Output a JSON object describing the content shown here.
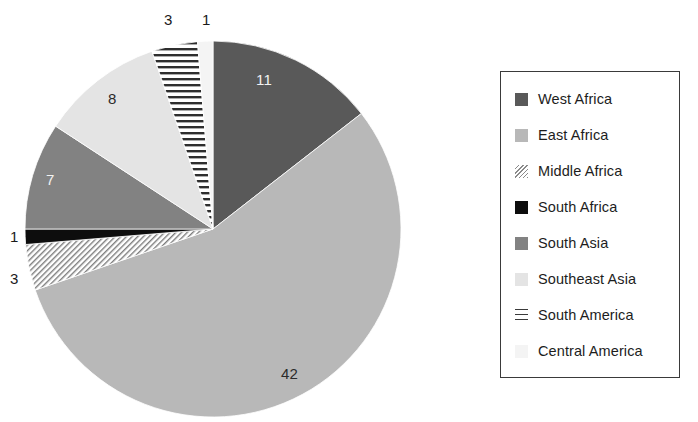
{
  "chart_data": {
    "type": "pie",
    "title": "",
    "subtitle": "",
    "xlabel": "",
    "ylabel": "",
    "total": 76,
    "start_angle_deg": 0,
    "direction": "clockwise",
    "legend_position": "right",
    "grid": false,
    "categories": [
      "West Africa",
      "East Africa",
      "Middle Africa",
      "South Africa",
      "South Asia",
      "Southeast Asia",
      "South America",
      "Central America"
    ],
    "values": [
      11,
      42,
      3,
      1,
      7,
      8,
      3,
      1
    ],
    "slices": [
      {
        "label": "West Africa",
        "value": 11,
        "value_text": "11",
        "fill": "#595959",
        "pattern": "solid",
        "label_color": "#f2f2f2"
      },
      {
        "label": "East Africa",
        "value": 42,
        "value_text": "42",
        "fill": "#b8b8b8",
        "pattern": "solid",
        "label_color": "#2b2b2b"
      },
      {
        "label": "Middle Africa",
        "value": 3,
        "value_text": "3",
        "fill": "#ffffff",
        "pattern": "diagonal-hatch",
        "label_color": "#1a1a1a"
      },
      {
        "label": "South Africa",
        "value": 1,
        "value_text": "1",
        "fill": "#0d0d0d",
        "pattern": "solid",
        "label_color": "#1a1a1a"
      },
      {
        "label": "South Asia",
        "value": 7,
        "value_text": "7",
        "fill": "#828282",
        "pattern": "solid",
        "label_color": "#f2f2f2"
      },
      {
        "label": "Southeast Asia",
        "value": 8,
        "value_text": "8",
        "fill": "#e4e4e4",
        "pattern": "solid",
        "label_color": "#2b2b2b"
      },
      {
        "label": "South America",
        "value": 3,
        "value_text": "3",
        "fill": "#ffffff",
        "pattern": "horizontal-stripes",
        "label_color": "#1a1a1a"
      },
      {
        "label": "Central America",
        "value": 1,
        "value_text": "1",
        "fill": "#f4f4f4",
        "pattern": "solid",
        "label_color": "#1a1a1a"
      }
    ]
  },
  "legend": {
    "border_color": "#3a3a3a",
    "items": [
      {
        "label": "West Africa",
        "swatch": "west-africa"
      },
      {
        "label": "East Africa",
        "swatch": "east-africa"
      },
      {
        "label": "Middle Africa",
        "swatch": "middle-africa"
      },
      {
        "label": "South Africa",
        "swatch": "south-africa"
      },
      {
        "label": "South Asia",
        "swatch": "south-asia"
      },
      {
        "label": "Southeast Asia",
        "swatch": "southeast-asia"
      },
      {
        "label": "South America",
        "swatch": "south-america"
      },
      {
        "label": "Central America",
        "swatch": "central-america"
      }
    ]
  }
}
